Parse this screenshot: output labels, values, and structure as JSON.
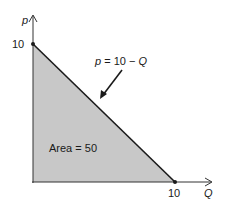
{
  "diagram": {
    "y_axis_label": "p",
    "x_axis_label": "Q",
    "y_intercept_label": "10",
    "x_intercept_label": "10",
    "curve_label_var": "p",
    "curve_label_eq": " = 10 − ",
    "curve_label_q": "Q",
    "area_label": "Area = 50",
    "colors": {
      "fill": "#c8c8c8",
      "line": "#1a1a1a",
      "axis": "#333333"
    }
  }
}
